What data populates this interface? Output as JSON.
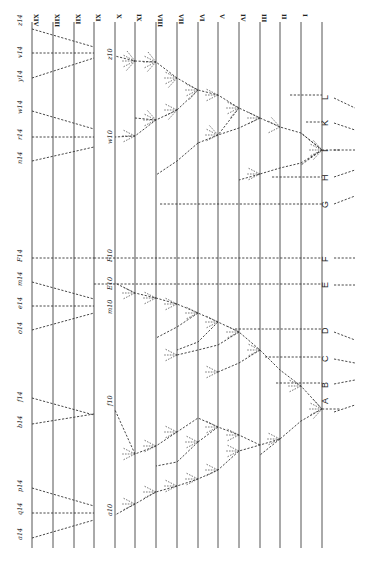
{
  "diagram": {
    "generations": [
      "XIV",
      "XIII",
      "XII",
      "XI",
      "X",
      "IX",
      "VIII",
      "VII",
      "VI",
      "V",
      "IV",
      "III",
      "II",
      "I"
    ],
    "base_species": [
      "A",
      "B",
      "C",
      "D",
      "E",
      "F",
      "G",
      "H",
      "I",
      "K",
      "L"
    ],
    "generation_14_labels": [
      "z14",
      "v14",
      "y14",
      "w14",
      "r14",
      "n14",
      "F14",
      "m14",
      "e14",
      "o14",
      "f14",
      "b14",
      "p14",
      "q14",
      "a14"
    ],
    "generation_10_labels": [
      "z10",
      "w10",
      "F10",
      "E10",
      "m10",
      "f10",
      "a10"
    ],
    "intermediate_labels": [
      "z9",
      "z8",
      "z7",
      "z6",
      "z5",
      "z4",
      "z3",
      "z2",
      "z1",
      "w9",
      "w8",
      "w7",
      "u8",
      "u7",
      "u6",
      "u5",
      "i3",
      "i2",
      "i1",
      "m9",
      "m8",
      "m7",
      "m6",
      "m5",
      "m4",
      "m3",
      "m2",
      "m1",
      "l7",
      "l6",
      "l5",
      "k8",
      "k7",
      "k6",
      "k5",
      "k4",
      "d9",
      "d8",
      "f9",
      "f8",
      "f7",
      "f6",
      "f5",
      "a9",
      "a8",
      "a7",
      "a6",
      "a5",
      "a4",
      "a3",
      "a2",
      "a1",
      "s2",
      "t2"
    ]
  }
}
